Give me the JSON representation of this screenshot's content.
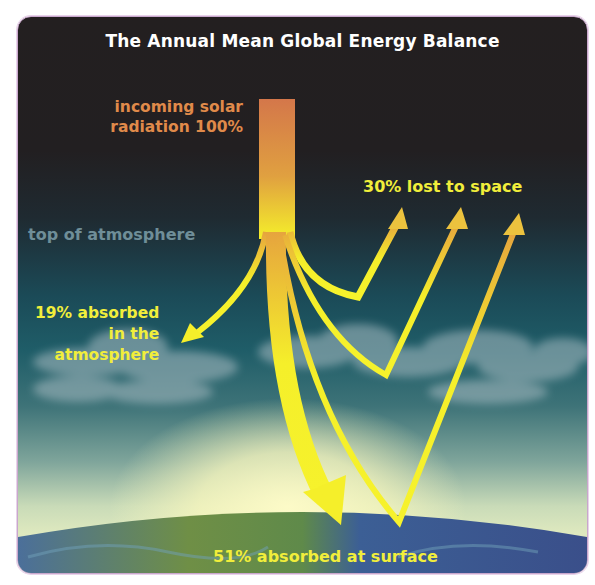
{
  "diagram": {
    "title": "The Annual Mean Global Energy Balance",
    "labels": {
      "incoming_line1": "incoming solar",
      "incoming_line2": "radiation 100%",
      "top_of_atmosphere": "top of atmosphere",
      "lost_to_space": "30% lost to space",
      "absorbed_atm_line1": "19% absorbed",
      "absorbed_atm_line2": "in the",
      "absorbed_atm_line3": "atmosphere",
      "absorbed_surface": "51% absorbed at surface"
    },
    "flows": [
      {
        "name": "incoming solar radiation",
        "percent": 100
      },
      {
        "name": "lost to space",
        "percent": 30
      },
      {
        "name": "absorbed in the atmosphere",
        "percent": 19
      },
      {
        "name": "absorbed at surface",
        "percent": 51
      }
    ],
    "colors": {
      "title": "#ffffff",
      "incoming": "#e08a4a",
      "arrow_yellow": "#f5ef2a",
      "arrow_orange": "#d9874b",
      "label_yellow": "#f1ee3b",
      "top_of_atmosphere": "#6f8e98",
      "space": "#231f20",
      "atmosphere": "#1b4a57",
      "frame_border": "#c9a7cc"
    }
  }
}
